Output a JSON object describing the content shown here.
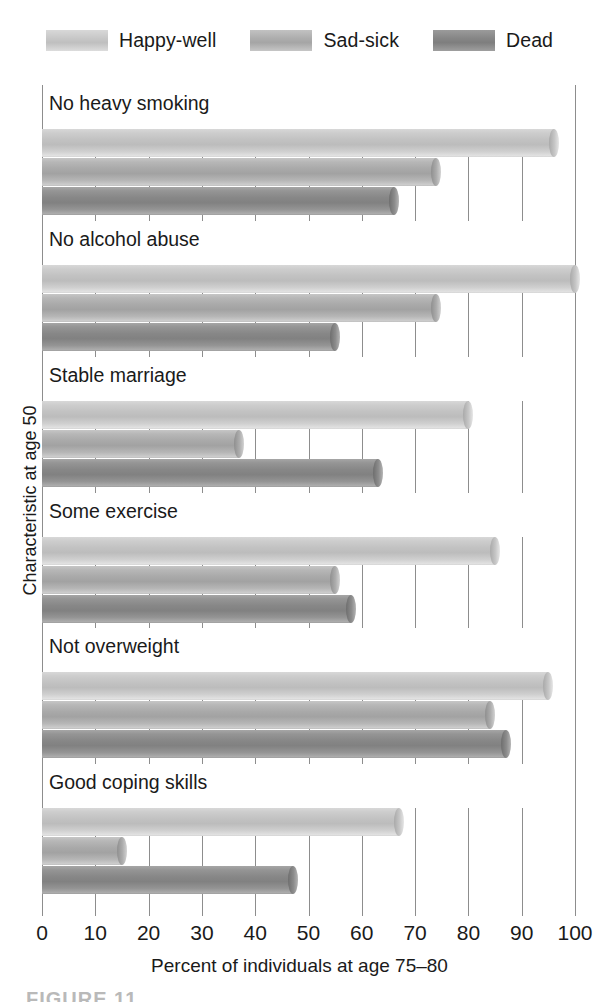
{
  "chart_data": {
    "type": "bar",
    "orientation": "horizontal",
    "title": "",
    "xlabel": "Percent of individuals at age 75–80",
    "ylabel": "Characteristic at age 50",
    "xlim": [
      0,
      100
    ],
    "xticks": [
      0,
      10,
      20,
      30,
      40,
      50,
      60,
      70,
      80,
      90,
      100
    ],
    "xtick_labels": [
      "0",
      "10",
      "20",
      "30",
      "40",
      "50",
      "60",
      "70",
      "80",
      "90",
      "100"
    ],
    "grid": true,
    "legend_position": "top",
    "categories": [
      "No heavy smoking",
      "No alcohol abuse",
      "Stable marriage",
      "Some exercise",
      "Not overweight",
      "Good coping skills"
    ],
    "series": [
      {
        "name": "Happy-well",
        "color": "#c2c2c2",
        "values": [
          96,
          100,
          80,
          85,
          95,
          67
        ]
      },
      {
        "name": "Sad-sick",
        "color": "#a9a9a9",
        "values": [
          74,
          74,
          37,
          55,
          84,
          15
        ]
      },
      {
        "name": "Dead",
        "color": "#878787",
        "values": [
          66,
          55,
          63,
          58,
          87,
          47
        ]
      }
    ]
  },
  "legend": {
    "entries": [
      {
        "label": "Happy-well"
      },
      {
        "label": "Sad-sick"
      },
      {
        "label": "Dead"
      }
    ]
  },
  "caption": {
    "text": "FIGURE 11"
  }
}
